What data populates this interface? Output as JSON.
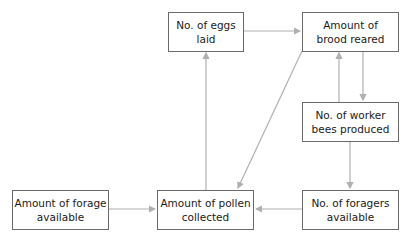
{
  "diagram": {
    "nodes": [
      {
        "id": "eggs",
        "lines": [
          "No. of eggs",
          "laid"
        ]
      },
      {
        "id": "brood",
        "lines": [
          "Amount of",
          "brood reared"
        ]
      },
      {
        "id": "workers",
        "lines": [
          "No. of worker",
          "bees produced"
        ]
      },
      {
        "id": "forage",
        "lines": [
          "Amount of forage",
          "available"
        ]
      },
      {
        "id": "pollen",
        "lines": [
          "Amount of pollen",
          "collected"
        ]
      },
      {
        "id": "foragers",
        "lines": [
          "No. of foragers",
          "available"
        ]
      }
    ],
    "edges": [
      {
        "from": "eggs",
        "to": "brood"
      },
      {
        "from": "brood",
        "to": "workers"
      },
      {
        "from": "workers",
        "to": "brood"
      },
      {
        "from": "workers",
        "to": "foragers"
      },
      {
        "from": "foragers",
        "to": "pollen"
      },
      {
        "from": "forage",
        "to": "pollen"
      },
      {
        "from": "pollen",
        "to": "eggs"
      },
      {
        "from": "brood",
        "to": "pollen"
      }
    ],
    "colors": {
      "edge": "#b0b0b0",
      "border": "#6a6a6a"
    }
  }
}
